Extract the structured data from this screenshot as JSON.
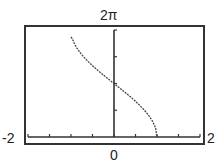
{
  "chart_data": {
    "type": "line",
    "title": "",
    "xlabel": "",
    "ylabel": "",
    "xlim": [
      -2,
      2
    ],
    "ylim": [
      0,
      6.2832
    ],
    "x_tick_labels": {
      "min": "-2",
      "origin": "0",
      "max": "2"
    },
    "y_tick_labels": {
      "max": "2π"
    },
    "x_tick_step": 0.5,
    "y_tick_step": "π/2",
    "grid": false,
    "series": [
      {
        "name": "y = 2·arccos(x)",
        "x": [
          -1,
          -0.9,
          -0.8,
          -0.6,
          -0.4,
          -0.2,
          0,
          0.2,
          0.4,
          0.6,
          0.8,
          0.9,
          1
        ],
        "y": [
          6.28,
          5.38,
          5.0,
          4.43,
          3.96,
          3.54,
          3.14,
          2.74,
          2.32,
          1.85,
          1.29,
          0.9,
          0
        ]
      }
    ]
  }
}
